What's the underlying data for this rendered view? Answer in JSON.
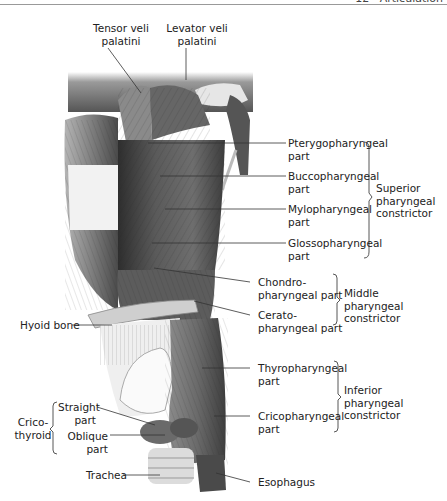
{
  "header": {
    "text": "12 · Articulation"
  },
  "figure": {
    "type": "anatomical illustration",
    "colors": {
      "ink": "#222222",
      "leader": "#333333",
      "muscle_dark": "#3a3a3a",
      "muscle_mid": "#7a7a7a",
      "bone": "#d8d8d8",
      "background": "#ffffff"
    }
  },
  "labels": {
    "tensor_veli_palatini": [
      "Tensor veli",
      "palatini"
    ],
    "levator_veli_palatini": [
      "Levator veli",
      "palatini"
    ],
    "pterygopharyngeal": [
      "Pterygopharyngeal",
      "part"
    ],
    "buccopharyngeal": [
      "Buccopharyngeal",
      "part"
    ],
    "mylopharyngeal": [
      "Mylopharyngeal",
      "part"
    ],
    "glossopharyngeal": [
      "Glossopharyngeal",
      "part"
    ],
    "superior_constrictor": [
      "Superior",
      "pharyngeal",
      "constrictor"
    ],
    "chondropharyngeal": [
      "Chondro-",
      "pharyngeal part"
    ],
    "ceratopharyngeal": [
      "Cerato-",
      "pharyngeal part"
    ],
    "middle_constrictor": [
      "Middle",
      "pharyngeal",
      "constrictor"
    ],
    "hyoid_bone": "Hyoid bone",
    "thyropharyngeal": [
      "Thyropharyngeal",
      "part"
    ],
    "cricopharyngeal": [
      "Cricopharyngeal",
      "part"
    ],
    "inferior_constrictor": [
      "Inferior",
      "pharyngeal",
      "constrictor"
    ],
    "straight_part": [
      "Straight",
      "part"
    ],
    "oblique_part": [
      "Oblique",
      "part"
    ],
    "cricothyroid": [
      "Crico-",
      "thyroid"
    ],
    "trachea": "Trachea",
    "esophagus": "Esophagus"
  }
}
